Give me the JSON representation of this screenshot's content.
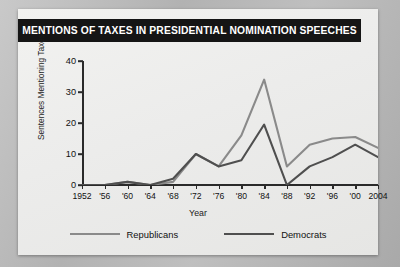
{
  "title": "MENTIONS OF TAXES IN PRESIDENTIAL NOMINATION SPEECHES",
  "legend": {
    "republicans_label": "Republicans",
    "democrats_label": "Democrats"
  },
  "colors": {
    "republicans": "#8a8a8a",
    "democrats": "#4f4f4f",
    "axis": "#2a2a2a",
    "title_bar": "#151515",
    "title_text": "#ffffff",
    "card": "#efefed",
    "backdrop": "#b8b8b8"
  },
  "chart_data": {
    "type": "line",
    "title": "MENTIONS OF TAXES IN PRESIDENTIAL NOMINATION SPEECHES",
    "xlabel": "Year",
    "ylabel": "Sentences Mentioning Taxes",
    "categories": [
      "1952",
      "'56",
      "'60",
      "'64",
      "'68",
      "'72",
      "'76",
      "'80",
      "'84",
      "'88",
      "'92",
      "'96",
      "'00",
      "2004"
    ],
    "x": [
      1952,
      1956,
      1960,
      1964,
      1968,
      1972,
      1976,
      1980,
      1984,
      1988,
      1992,
      1996,
      2000,
      2004
    ],
    "xlim": [
      1952,
      2004
    ],
    "ylim": [
      0,
      40
    ],
    "yticks": [
      0,
      10,
      20,
      30,
      40
    ],
    "grid": false,
    "legend_position": "bottom",
    "series": [
      {
        "name": "Republicans",
        "color": "#8a8a8a",
        "values": [
          0,
          0,
          1,
          0,
          1,
          10,
          6,
          16,
          34,
          6,
          13,
          15,
          15.5,
          12
        ]
      },
      {
        "name": "Democrats",
        "color": "#4f4f4f",
        "values": [
          0,
          0,
          1,
          0,
          2,
          10,
          6,
          8,
          19.5,
          0,
          6,
          9,
          13,
          9
        ]
      }
    ]
  }
}
